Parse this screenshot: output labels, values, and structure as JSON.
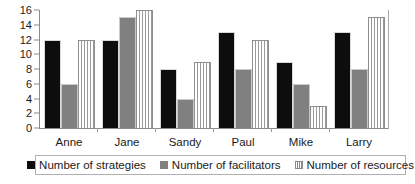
{
  "chart_data": {
    "type": "bar",
    "title": "",
    "subtitle": "",
    "xlabel": "",
    "ylabel": "",
    "ylim": [
      0,
      16
    ],
    "yticks": [
      0,
      2,
      4,
      6,
      8,
      10,
      12,
      14,
      16
    ],
    "ytick_labels": [
      "0",
      "2",
      "4",
      "6",
      "8",
      "10",
      "12",
      "14",
      "16"
    ],
    "grid": false,
    "legend_position": "bottom",
    "categories": [
      "Anne",
      "Jane",
      "Sandy",
      "Paul",
      "Mike",
      "Larry"
    ],
    "series": [
      {
        "name": "Number of strategies",
        "color": "#0d0d0d",
        "fill": "solid-black",
        "values": [
          12,
          12,
          8,
          13,
          9,
          13
        ]
      },
      {
        "name": "Number of facilitators",
        "color": "#808080",
        "fill": "solid-gray",
        "values": [
          6,
          15,
          4,
          8,
          6,
          8
        ]
      },
      {
        "name": "Number of resources",
        "color": "#ffffff",
        "fill": "vertical-stripes",
        "values": [
          12,
          16,
          9,
          12,
          3,
          15
        ]
      }
    ]
  },
  "legend": {
    "entries": [
      {
        "label": "Number of strategies",
        "swatch": "solid-black-swatch-icon"
      },
      {
        "label": "Number of facilitators",
        "swatch": "solid-gray-swatch-icon"
      },
      {
        "label": "Number of resources",
        "swatch": "striped-swatch-icon"
      }
    ]
  },
  "colors": {
    "strategies": "#0d0d0d",
    "facilitators": "#808080",
    "resources": "#ffffff",
    "axis": "#8a8a8a",
    "text": "#1a1a1a",
    "background": "#ffffff"
  }
}
